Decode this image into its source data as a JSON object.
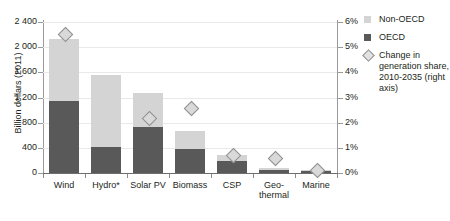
{
  "chart_data": {
    "type": "bar",
    "title": "2012-2035",
    "title_truncated": true,
    "categories": [
      "Wind",
      "Hydro*",
      "Solar PV",
      "Biomass",
      "CSP",
      "Geo-",
      "Marine"
    ],
    "category_labels_line2": [
      "",
      "",
      "",
      "",
      "",
      "thermal",
      ""
    ],
    "series": [
      {
        "name": "OECD",
        "values": [
          1150,
          420,
          730,
          380,
          190,
          55,
          25
        ],
        "color": "#595959"
      },
      {
        "name": "Non-OECD",
        "values": [
          980,
          1130,
          540,
          290,
          100,
          25,
          20
        ],
        "color": "#d4d4d4"
      }
    ],
    "totals": [
      2130,
      1550,
      1270,
      670,
      290,
      80,
      45
    ],
    "marker_series": {
      "name": "Change in generation share, 2010-2035 (right axis)",
      "axis": "right",
      "values": [
        5.55,
        null,
        2.2,
        2.6,
        0.75,
        0.6,
        0.15
      ],
      "color": "#d9d9d9"
    },
    "ylabel": "Billion dollars (2011)",
    "ylabel_right": "",
    "xlabel": "",
    "ylim": [
      0,
      2400
    ],
    "ylim_right": [
      0,
      6
    ],
    "yticks": [
      "0",
      "400",
      "800",
      "1 200",
      "1 600",
      "2 000",
      "2 400"
    ],
    "yticks_right": [
      "0%",
      "1%",
      "2%",
      "3%",
      "4%",
      "5%",
      "6%"
    ],
    "grid": true,
    "legend_position": "right",
    "stacked": true
  },
  "axes": {
    "left_title": "Billion dollars (2011)",
    "left_ticks": [
      {
        "label": "2 400",
        "value": 2400
      },
      {
        "label": "2 000",
        "value": 2000
      },
      {
        "label": "1 600",
        "value": 1600
      },
      {
        "label": "1 200",
        "value": 1200
      },
      {
        "label": "800",
        "value": 800
      },
      {
        "label": "400",
        "value": 400
      },
      {
        "label": "0",
        "value": 0
      }
    ],
    "right_ticks": [
      {
        "label": "6%",
        "value": 6
      },
      {
        "label": "5%",
        "value": 5
      },
      {
        "label": "4%",
        "value": 4
      },
      {
        "label": "3%",
        "value": 3
      },
      {
        "label": "2%",
        "value": 2
      },
      {
        "label": "1%",
        "value": 1
      },
      {
        "label": "0%",
        "value": 0
      }
    ]
  },
  "legend": {
    "items": [
      {
        "key": "non-oecd",
        "label": "Non-OECD",
        "marker": "square",
        "color": "#d4d4d4"
      },
      {
        "key": "oecd",
        "label": "OECD",
        "marker": "square",
        "color": "#595959"
      },
      {
        "key": "change",
        "label": "Change in generation share, 2010-2035 (right axis)",
        "marker": "diamond",
        "color": "#d9d9d9"
      }
    ]
  }
}
